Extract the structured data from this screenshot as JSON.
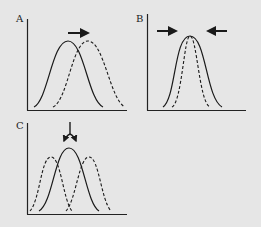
{
  "figure": {
    "background": "#e6e6e6",
    "line_color": "#1a1a1a",
    "panels": [
      {
        "label": "A",
        "curves": [
          "solid original distribution",
          "dashed shifted distribution"
        ],
        "arrow": "right"
      },
      {
        "label": "B",
        "curves": [
          "solid wide distribution",
          "dashed narrow distribution"
        ],
        "arrow": "inward from both sides"
      },
      {
        "label": "C",
        "curves": [
          "solid central distribution",
          "dashed left distribution",
          "dashed right distribution"
        ],
        "arrow": "splitting downward"
      }
    ]
  }
}
